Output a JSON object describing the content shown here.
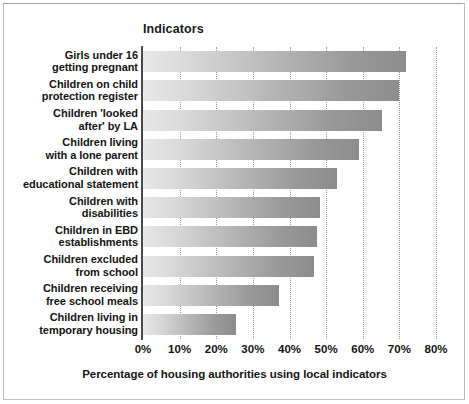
{
  "chart_data": {
    "type": "bar",
    "orientation": "horizontal",
    "title": "Indicators",
    "xlabel": "Percentage of housing authorities using local indicators",
    "ylabel": "",
    "xlim": [
      0,
      80
    ],
    "xtick_labels": [
      "0%",
      "10%",
      "20%",
      "30%",
      "40%",
      "50%",
      "60%",
      "70%",
      "80%"
    ],
    "xticks": [
      0,
      10,
      20,
      30,
      40,
      50,
      60,
      70,
      80
    ],
    "grid": "vertical-dotted",
    "legend": "none",
    "categories": [
      "Girls under 16\ngetting pregnant",
      "Children on child\nprotection register",
      "Children 'looked\nafter' by LA",
      "Children living\nwith a lone parent",
      "Children with\neducational statement",
      "Children with\ndisabilities",
      "Children in EBD\nestablishments",
      "Children excluded\nfrom school",
      "Children receiving\nfree school meals",
      "Children living in\ntemporary housing"
    ],
    "values": [
      71.7,
      69.8,
      65.3,
      59.1,
      52.9,
      48.4,
      47.4,
      46.6,
      37.2,
      25.4
    ],
    "bar_fill": "gradient-light-to-dark-gray",
    "bar_color_start": "#e8e8e8",
    "bar_color_end": "#8c8c8c",
    "axis_color": "#4a4a4a",
    "gridline_color": "#9a9a9a",
    "text_color": "#141414"
  }
}
